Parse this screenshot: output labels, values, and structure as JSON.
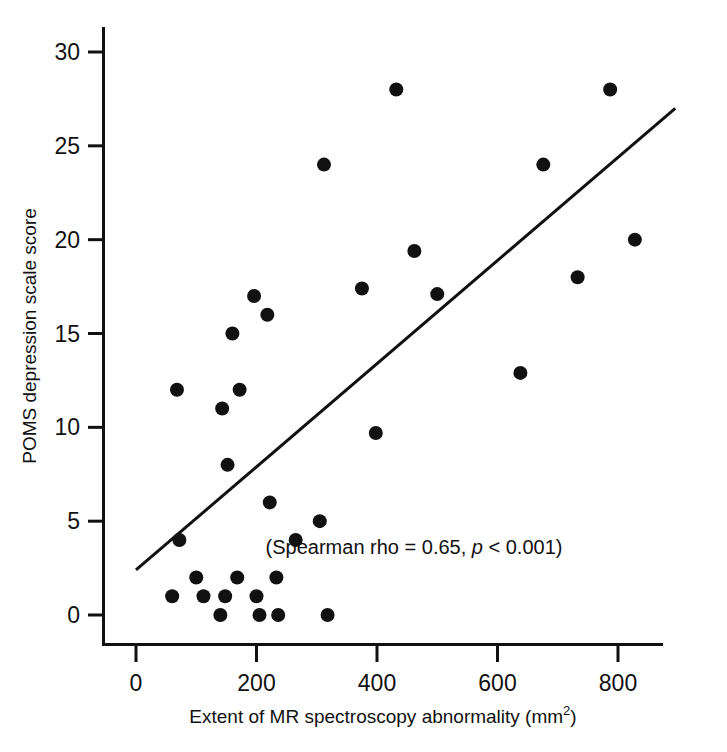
{
  "figure": {
    "background": "#ffffff",
    "ink_color": "#111111"
  },
  "chart_data": {
    "type": "scatter",
    "title": "",
    "xlabel": "Extent of MR spectroscopy abnormality (mm",
    "xlabel_sup": "2",
    "xlabel_tail": ")",
    "xlabel_full": "Extent of MR spectroscopy abnormality (mm2)",
    "ylabel": "POMS depression scale score",
    "xlim": [
      -55,
      925
    ],
    "ylim": [
      -1.6,
      31.6
    ],
    "xticks": [
      0,
      200,
      400,
      600,
      800
    ],
    "xtick_labels": [
      "0",
      "200",
      "400",
      "600",
      "800"
    ],
    "yticks": [
      0,
      5,
      10,
      15,
      20,
      25,
      30
    ],
    "ytick_labels": [
      "0",
      "5",
      "10",
      "15",
      "20",
      "25",
      "30"
    ],
    "grid": false,
    "legend": "none",
    "marker": {
      "shape": "circle",
      "color": "#111111",
      "size": 11
    },
    "points": [
      {
        "x": 60,
        "y": 1
      },
      {
        "x": 68,
        "y": 12
      },
      {
        "x": 72,
        "y": 4
      },
      {
        "x": 100,
        "y": 2
      },
      {
        "x": 112,
        "y": 1
      },
      {
        "x": 140,
        "y": 0
      },
      {
        "x": 143,
        "y": 11
      },
      {
        "x": 148,
        "y": 1
      },
      {
        "x": 152,
        "y": 8
      },
      {
        "x": 160,
        "y": 15
      },
      {
        "x": 168,
        "y": 2
      },
      {
        "x": 172,
        "y": 12
      },
      {
        "x": 196,
        "y": 17
      },
      {
        "x": 200,
        "y": 1
      },
      {
        "x": 205,
        "y": 0
      },
      {
        "x": 218,
        "y": 16
      },
      {
        "x": 222,
        "y": 6
      },
      {
        "x": 233,
        "y": 2
      },
      {
        "x": 236,
        "y": 0
      },
      {
        "x": 265,
        "y": 4
      },
      {
        "x": 305,
        "y": 5
      },
      {
        "x": 312,
        "y": 24
      },
      {
        "x": 318,
        "y": 0
      },
      {
        "x": 375,
        "y": 17.4
      },
      {
        "x": 398,
        "y": 9.7
      },
      {
        "x": 432,
        "y": 28
      },
      {
        "x": 462,
        "y": 19.4
      },
      {
        "x": 500,
        "y": 17.1
      },
      {
        "x": 638,
        "y": 12.9
      },
      {
        "x": 676,
        "y": 24
      },
      {
        "x": 733,
        "y": 18
      },
      {
        "x": 787,
        "y": 28
      },
      {
        "x": 828,
        "y": 20
      }
    ],
    "trend_line": {
      "type": "linear-fit",
      "x_start": 0,
      "y_start": 2.4,
      "x_end": 895,
      "y_end": 27.0,
      "color": "#111111",
      "width": 3
    },
    "annotation": {
      "prefix": "(Spearman rho = 0.65, ",
      "italic": "p",
      "suffix": " < 0.001)",
      "full_text": "(Spearman rho = 0.65, p < 0.001)",
      "stat_name": "Spearman rho",
      "stat_value": "0.65",
      "p_value": "< 0.001"
    }
  }
}
